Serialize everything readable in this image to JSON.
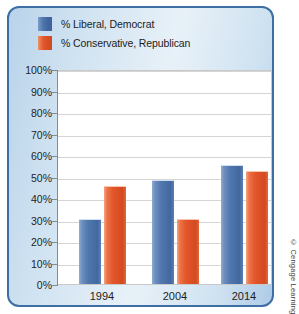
{
  "chart_data": {
    "type": "bar",
    "title": "",
    "subtitle": "",
    "xlabel": "",
    "ylabel": "",
    "categories": [
      "1994",
      "2004",
      "2014"
    ],
    "series": [
      {
        "name": "% Liberal, Democrat",
        "color": "#4a70a8",
        "values": [
          30,
          48,
          55
        ]
      },
      {
        "name": "% Conservative, Republican",
        "color": "#e2562a",
        "values": [
          45,
          30,
          52
        ]
      }
    ],
    "ylim": [
      0,
      100
    ],
    "y_ticks": [
      "100%",
      "90%",
      "80%",
      "70%",
      "60%",
      "50%",
      "40%",
      "30%",
      "20%",
      "10%",
      "0%"
    ],
    "y_tick_values": [
      100,
      90,
      80,
      70,
      60,
      50,
      40,
      30,
      20,
      10,
      0
    ],
    "grid": true,
    "legend_position": "top-left"
  },
  "legend": {
    "items": [
      {
        "label": "% Liberal, Democrat",
        "swatch": "blue"
      },
      {
        "label": "% Conservative, Republican",
        "swatch": "orange"
      }
    ]
  },
  "credit": {
    "text": "© Cengage Learning"
  },
  "colors": {
    "series_blue": "#4a70a8",
    "series_orange": "#e2562a",
    "panel_border": "#3d6fa5",
    "grid": "#d5d5d5",
    "axis": "#8a8a8a",
    "plot_background": "#ffffff"
  }
}
